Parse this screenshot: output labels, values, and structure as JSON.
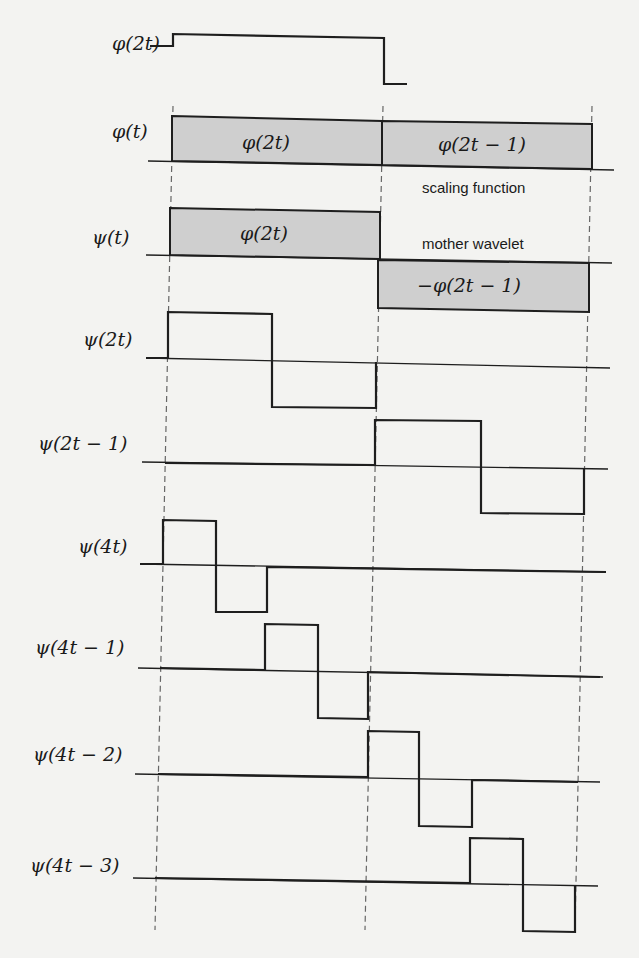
{
  "colors": {
    "background": "#f3f3f1",
    "line": "#1e1e1e",
    "fill": "#cfcfcf",
    "dashed": "#666666"
  },
  "annotations": {
    "scaling": "scaling function",
    "wavelet": "mother wavelet"
  },
  "rows": [
    {
      "id": "phi-2t",
      "label": "φ(2t)",
      "label_x": 112,
      "label_y": 34,
      "path": [
        [
          150,
          46
        ],
        [
          173,
          46
        ],
        [
          173,
          34
        ],
        [
          384,
          38
        ],
        [
          384,
          84
        ],
        [
          407,
          84
        ]
      ],
      "baseline": null
    },
    {
      "id": "phi-t",
      "label": "φ(t)",
      "label_x": 112,
      "label_y": 122,
      "baseline": [
        [
          148,
          161
        ],
        [
          614,
          170
        ]
      ],
      "boxes": [
        {
          "x1": 172,
          "x2": 382,
          "top": [
            116,
            121
          ],
          "bottom": [
            161,
            165
          ],
          "text": "φ(2t)",
          "text_x": 242,
          "text_y": 133
        },
        {
          "x1": 382,
          "x2": 592,
          "top": [
            121,
            124
          ],
          "bottom": [
            165,
            169
          ],
          "text": "φ(2t − 1)",
          "text_x": 438,
          "text_y": 135
        }
      ]
    },
    {
      "id": "psi-t",
      "label": "ψ(t)",
      "label_x": 92,
      "label_y": 228,
      "baseline": [
        [
          146,
          255
        ],
        [
          612,
          263
        ]
      ],
      "boxes": [
        {
          "x1": 170,
          "x2": 380,
          "top": [
            208,
            212
          ],
          "bottom": [
            255,
            259
          ],
          "text": "φ(2t)",
          "text_x": 240,
          "text_y": 224
        },
        {
          "x1": 378,
          "x2": 589,
          "top": [
            260,
            263
          ],
          "bottom": [
            308,
            312
          ],
          "text": "−φ(2t − 1)",
          "text_x": 417,
          "text_y": 276
        }
      ]
    },
    {
      "id": "psi-2t",
      "label": "ψ(2t)",
      "label_x": 83,
      "label_y": 330,
      "baseline": [
        [
          146,
          358
        ],
        [
          610,
          368
        ]
      ],
      "path": [
        [
          146,
          358
        ],
        [
          168,
          358
        ],
        [
          168,
          312
        ],
        [
          272,
          314
        ],
        [
          272,
          407
        ],
        [
          376,
          408
        ],
        [
          376,
          362
        ]
      ]
    },
    {
      "id": "psi-2t-1",
      "label": "ψ(2t − 1)",
      "label_x": 38,
      "label_y": 434,
      "baseline": [
        [
          142,
          462
        ],
        [
          608,
          469
        ]
      ],
      "path": [
        [
          165,
          463
        ],
        [
          375,
          465
        ],
        [
          375,
          420
        ],
        [
          481,
          421
        ],
        [
          481,
          513
        ],
        [
          584,
          514
        ],
        [
          584,
          469
        ]
      ]
    },
    {
      "id": "psi-4t",
      "label": "ψ(4t)",
      "label_x": 78,
      "label_y": 537,
      "baseline": [
        [
          140,
          564
        ],
        [
          606,
          572
        ]
      ],
      "path": [
        [
          140,
          564
        ],
        [
          163,
          564
        ],
        [
          163,
          520
        ],
        [
          216,
          521
        ],
        [
          216,
          612
        ],
        [
          267,
          612
        ],
        [
          267,
          567
        ],
        [
          606,
          572
        ]
      ]
    },
    {
      "id": "psi-4t-1",
      "label": "ψ(4t − 1)",
      "label_x": 35,
      "label_y": 638,
      "baseline": [
        [
          138,
          668
        ],
        [
          603,
          677
        ]
      ],
      "path": [
        [
          160,
          668
        ],
        [
          265,
          670
        ],
        [
          265,
          624
        ],
        [
          318,
          625
        ],
        [
          318,
          718
        ],
        [
          368,
          719
        ],
        [
          368,
          672
        ],
        [
          600,
          677
        ]
      ]
    },
    {
      "id": "psi-4t-2",
      "label": "ψ(4t − 2)",
      "label_x": 33,
      "label_y": 745,
      "baseline": [
        [
          135,
          774
        ],
        [
          600,
          782
        ]
      ],
      "path": [
        [
          158,
          774
        ],
        [
          368,
          777
        ],
        [
          368,
          731
        ],
        [
          419,
          732
        ],
        [
          419,
          826
        ],
        [
          472,
          827
        ],
        [
          472,
          780
        ],
        [
          578,
          782
        ]
      ]
    },
    {
      "id": "psi-4t-3",
      "label": "ψ(4t − 3)",
      "label_x": 30,
      "label_y": 856,
      "baseline": [
        [
          133,
          878
        ],
        [
          598,
          886
        ]
      ],
      "path": [
        [
          155,
          878
        ],
        [
          470,
          883
        ],
        [
          470,
          838
        ],
        [
          523,
          839
        ],
        [
          523,
          931
        ],
        [
          575,
          932
        ],
        [
          575,
          886
        ]
      ]
    }
  ],
  "dashed_lines": [
    {
      "from": [
        173,
        106
      ],
      "to": [
        155,
        930
      ]
    },
    {
      "from": [
        383,
        106
      ],
      "to": [
        365,
        930
      ]
    },
    {
      "from": [
        592,
        106
      ],
      "to": [
        575,
        930
      ]
    }
  ],
  "note_positions": {
    "scaling": {
      "x": 422,
      "y": 180
    },
    "wavelet": {
      "x": 422,
      "y": 236
    }
  }
}
